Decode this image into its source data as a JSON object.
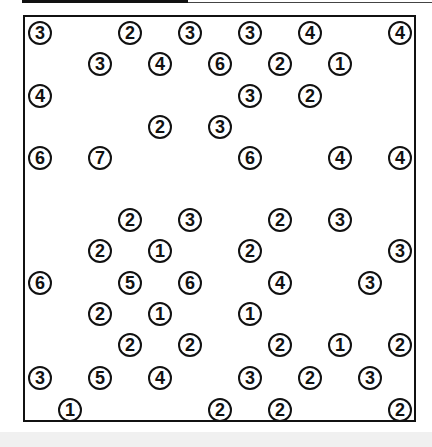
{
  "puzzle": {
    "type": "hashiwokakero",
    "rows": 13,
    "cols": 13,
    "colors": {
      "border": "#111111",
      "background": "#ffffff",
      "footer": "#f0f0f0"
    },
    "islands": [
      {
        "r": 0,
        "c": 0,
        "v": "3"
      },
      {
        "r": 0,
        "c": 3,
        "v": "2"
      },
      {
        "r": 0,
        "c": 5,
        "v": "3"
      },
      {
        "r": 0,
        "c": 7,
        "v": "3"
      },
      {
        "r": 0,
        "c": 9,
        "v": "4"
      },
      {
        "r": 0,
        "c": 12,
        "v": "4"
      },
      {
        "r": 1,
        "c": 2,
        "v": "3"
      },
      {
        "r": 1,
        "c": 4,
        "v": "4"
      },
      {
        "r": 1,
        "c": 6,
        "v": "6"
      },
      {
        "r": 1,
        "c": 8,
        "v": "2"
      },
      {
        "r": 1,
        "c": 10,
        "v": "1"
      },
      {
        "r": 2,
        "c": 0,
        "v": "4"
      },
      {
        "r": 2,
        "c": 7,
        "v": "3"
      },
      {
        "r": 2,
        "c": 9,
        "v": "2"
      },
      {
        "r": 3,
        "c": 4,
        "v": "2"
      },
      {
        "r": 3,
        "c": 6,
        "v": "3"
      },
      {
        "r": 4,
        "c": 0,
        "v": "6"
      },
      {
        "r": 4,
        "c": 2,
        "v": "7"
      },
      {
        "r": 4,
        "c": 7,
        "v": "6"
      },
      {
        "r": 4,
        "c": 10,
        "v": "4"
      },
      {
        "r": 4,
        "c": 12,
        "v": "4"
      },
      {
        "r": 6,
        "c": 3,
        "v": "2"
      },
      {
        "r": 6,
        "c": 5,
        "v": "3"
      },
      {
        "r": 6,
        "c": 8,
        "v": "2"
      },
      {
        "r": 6,
        "c": 10,
        "v": "3"
      },
      {
        "r": 7,
        "c": 2,
        "v": "2"
      },
      {
        "r": 7,
        "c": 4,
        "v": "1"
      },
      {
        "r": 7,
        "c": 7,
        "v": "2"
      },
      {
        "r": 7,
        "c": 12,
        "v": "3"
      },
      {
        "r": 8,
        "c": 0,
        "v": "6"
      },
      {
        "r": 8,
        "c": 3,
        "v": "5"
      },
      {
        "r": 8,
        "c": 5,
        "v": "6"
      },
      {
        "r": 8,
        "c": 8,
        "v": "4"
      },
      {
        "r": 8,
        "c": 11,
        "v": "3"
      },
      {
        "r": 9,
        "c": 2,
        "v": "2"
      },
      {
        "r": 9,
        "c": 4,
        "v": "1"
      },
      {
        "r": 9,
        "c": 7,
        "v": "1"
      },
      {
        "r": 10,
        "c": 3,
        "v": "2"
      },
      {
        "r": 10,
        "c": 5,
        "v": "2"
      },
      {
        "r": 10,
        "c": 8,
        "v": "2"
      },
      {
        "r": 10,
        "c": 10,
        "v": "1"
      },
      {
        "r": 10,
        "c": 12,
        "v": "2"
      },
      {
        "r": 11,
        "c": 0,
        "v": "3"
      },
      {
        "r": 11,
        "c": 2,
        "v": "5"
      },
      {
        "r": 11,
        "c": 4,
        "v": "4"
      },
      {
        "r": 11,
        "c": 7,
        "v": "3"
      },
      {
        "r": 11,
        "c": 9,
        "v": "2"
      },
      {
        "r": 11,
        "c": 11,
        "v": "3"
      },
      {
        "r": 12,
        "c": 1,
        "v": "1"
      },
      {
        "r": 12,
        "c": 6,
        "v": "2"
      },
      {
        "r": 12,
        "c": 8,
        "v": "2"
      },
      {
        "r": 12,
        "c": 12,
        "v": "2"
      }
    ]
  }
}
